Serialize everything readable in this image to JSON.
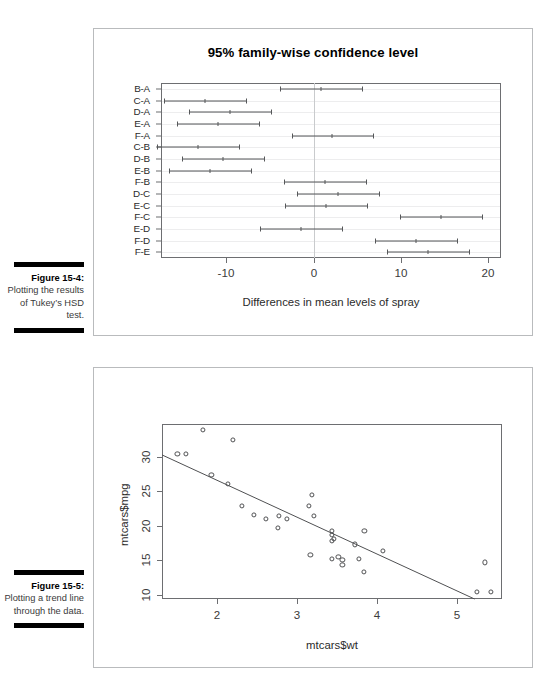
{
  "page": {
    "background": "#ffffff",
    "text_color": "#231f20",
    "line_color": "#555759"
  },
  "figures": [
    {
      "caption_title": "Figure 15-4:",
      "caption_text": "Plotting the results of Tukey’s HSD test."
    },
    {
      "caption_title": "Figure 15-5:",
      "caption_text": "Plotting a trend line through the data."
    }
  ],
  "chart_data": [
    {
      "type": "bar",
      "subtype": "confidence-interval-dotplot",
      "title": "95% family-wise confidence level",
      "xlabel": "Differences in mean levels of spray",
      "ylabel": "",
      "xlim": [
        -17.5,
        21.5
      ],
      "xticks": [
        -10,
        0,
        10,
        20
      ],
      "xtick_labels": [
        "-10",
        "0",
        "10",
        "20"
      ],
      "grid": true,
      "reference_line_x": 0,
      "categories": [
        "B-A",
        "C-A",
        "D-A",
        "E-A",
        "F-A",
        "C-B",
        "D-B",
        "E-B",
        "F-B",
        "D-C",
        "E-C",
        "F-C",
        "E-D",
        "F-D",
        "F-E"
      ],
      "series": [
        {
          "name": "diff",
          "values": [
            0.83,
            -12.42,
            -9.58,
            -11.0,
            2.17,
            -13.25,
            -10.42,
            -11.83,
            1.33,
            2.83,
            1.42,
            14.58,
            -1.42,
            11.75,
            13.17
          ]
        },
        {
          "name": "lower",
          "values": [
            -3.87,
            -17.12,
            -14.28,
            -15.71,
            -2.53,
            -17.95,
            -15.12,
            -16.54,
            -3.37,
            -1.87,
            -3.29,
            9.88,
            -6.12,
            7.04,
            8.46
          ]
        },
        {
          "name": "upper",
          "values": [
            5.54,
            -7.71,
            -4.87,
            -6.29,
            6.87,
            -8.54,
            -5.71,
            -7.12,
            6.04,
            7.54,
            6.12,
            19.29,
            3.29,
            16.46,
            17.87
          ]
        }
      ]
    },
    {
      "type": "scatter",
      "title": "",
      "xlabel": "mtcars$wt",
      "ylabel": "mtcars$mpg",
      "xlim": [
        1.32,
        5.56
      ],
      "ylim": [
        9.4,
        34.7
      ],
      "xticks": [
        2,
        3,
        4,
        5
      ],
      "xtick_labels": [
        "2",
        "3",
        "4",
        "5"
      ],
      "yticks": [
        10,
        15,
        20,
        25,
        30
      ],
      "ytick_labels": [
        "10",
        "15",
        "20",
        "25",
        "30"
      ],
      "grid": false,
      "marker": "open-circle",
      "trendline": {
        "type": "linear",
        "intercept": 37.285,
        "slope": -5.344
      },
      "x": [
        2.62,
        2.875,
        2.32,
        3.215,
        3.44,
        3.46,
        3.57,
        3.19,
        3.15,
        3.44,
        3.44,
        4.07,
        3.73,
        3.78,
        5.25,
        5.424,
        5.345,
        2.2,
        1.615,
        1.835,
        2.465,
        3.52,
        3.435,
        3.84,
        3.845,
        1.935,
        2.14,
        1.513,
        3.17,
        2.77,
        3.57,
        2.78
      ],
      "y": [
        21.0,
        21.0,
        22.8,
        21.4,
        18.7,
        18.1,
        14.3,
        24.4,
        22.8,
        19.2,
        17.8,
        16.4,
        17.3,
        15.2,
        10.4,
        10.4,
        14.7,
        32.4,
        30.4,
        33.9,
        21.5,
        15.5,
        15.2,
        13.3,
        19.2,
        27.3,
        26.0,
        30.4,
        15.8,
        19.7,
        15.0,
        21.4
      ]
    }
  ]
}
